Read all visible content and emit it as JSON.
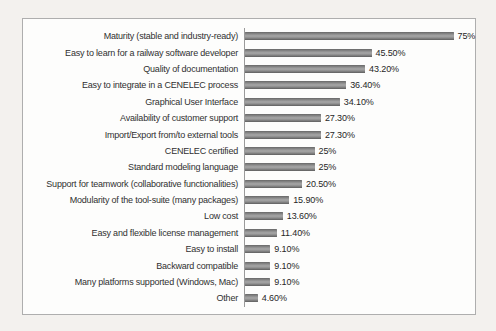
{
  "page": {
    "background_color": "#f3f1ee",
    "chart_background_color": "#fdfdfc",
    "chart_border_color": "#aeaeae",
    "axis_line_color": "#9a9a9a",
    "bar_color": "#8e8e8e",
    "text_color": "#303030"
  },
  "chart_data": {
    "type": "bar",
    "orientation": "horizontal",
    "title": "",
    "xlabel": "",
    "ylabel": "",
    "xlim": [
      0,
      83
    ],
    "grid": false,
    "legend": false,
    "categories": [
      "Maturity (stable and industry-ready)",
      "Easy to learn for a railway software developer",
      "Quality of documentation",
      "Easy to integrate in a CENELEC process",
      "Graphical User Interface",
      "Availability of customer support",
      "Import/Export from/to external tools",
      "CENELEC certified",
      "Standard modeling language",
      "Support for teamwork (collaborative functionalities)",
      "Modularity of the tool-suite (many packages)",
      "Low cost",
      "Easy and flexible license management",
      "Easy to install",
      "Backward compatible",
      "Many platforms supported (Windows, Mac)",
      "Other"
    ],
    "values": [
      75,
      45.5,
      43.2,
      36.4,
      34.1,
      27.3,
      27.3,
      25,
      25,
      20.5,
      15.9,
      13.6,
      11.4,
      9.1,
      9.1,
      9.1,
      4.6
    ],
    "value_labels": [
      "75%",
      "45.50%",
      "43.20%",
      "36.40%",
      "34.10%",
      "27.30%",
      "27.30%",
      "25%",
      "25%",
      "20.50%",
      "15.90%",
      "13.60%",
      "11.40%",
      "9.10%",
      "9.10%",
      "9.10%",
      "4.60%"
    ]
  }
}
